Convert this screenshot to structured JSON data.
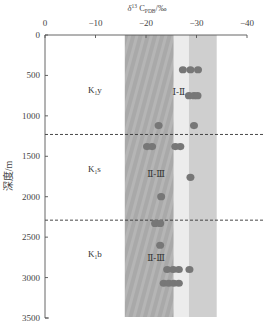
{
  "chart_data": {
    "type": "scatter",
    "xlabel": "δ13C PDB/‰",
    "ylabel": "深度/m",
    "x_axis_position": "top",
    "xlim": [
      0,
      -40
    ],
    "ylim": [
      0,
      3500
    ],
    "y_inverted": true,
    "xticks": [
      0,
      -10,
      -20,
      -30,
      -40
    ],
    "xtick_labels": [
      "0",
      "−10",
      "−20",
      "−30",
      "−40"
    ],
    "yticks": [
      0,
      500,
      1000,
      1500,
      2000,
      2500,
      3000,
      3500
    ],
    "ytick_labels": [
      "0",
      "500",
      "1000",
      "1500",
      "2000",
      "2500",
      "3000",
      "3500"
    ],
    "grid": false,
    "bands": [
      {
        "name": "dark-band",
        "x_from": -15.8,
        "x_to": -25.5,
        "color": "#a8a8a8"
      },
      {
        "name": "light-band",
        "x_from": -25.5,
        "x_to": -28.5,
        "color": "#ececec"
      },
      {
        "name": "mid-band",
        "x_from": -28.5,
        "x_to": -34.0,
        "color": "#cfcfcf"
      }
    ],
    "boundaries": [
      {
        "depth": 1230,
        "style": "dashed"
      },
      {
        "depth": 2290,
        "style": "dashed"
      }
    ],
    "formations": [
      {
        "label": "K",
        "sub": "1",
        "suffix": "y",
        "x": -8.5,
        "depth": 720
      },
      {
        "label": "K",
        "sub": "1",
        "suffix": "s",
        "x": -8.5,
        "depth": 1700
      },
      {
        "label": "K",
        "sub": "1",
        "suffix": "b",
        "x": -8.5,
        "depth": 2750
      }
    ],
    "type_labels": [
      {
        "text": "Ⅰ-Ⅱ",
        "x": -26.5,
        "depth": 740
      },
      {
        "text": "Ⅱ-Ⅲ",
        "x": -22.0,
        "depth": 1760
      },
      {
        "text": "Ⅱ-Ⅲ",
        "x": -22.0,
        "depth": 2800
      }
    ],
    "series": [
      {
        "name": "samples",
        "color": "#777777",
        "points": [
          {
            "x": -27.3,
            "depth": 430
          },
          {
            "x": -28.8,
            "depth": 430
          },
          {
            "x": -30.3,
            "depth": 430
          },
          {
            "x": -28.5,
            "depth": 750
          },
          {
            "x": -29.5,
            "depth": 750
          },
          {
            "x": -30.2,
            "depth": 750
          },
          {
            "x": -22.5,
            "depth": 1120
          },
          {
            "x": -29.5,
            "depth": 1120
          },
          {
            "x": -20.2,
            "depth": 1380
          },
          {
            "x": -21.2,
            "depth": 1380
          },
          {
            "x": -25.8,
            "depth": 1380
          },
          {
            "x": -26.8,
            "depth": 1380
          },
          {
            "x": -28.8,
            "depth": 1760
          },
          {
            "x": -23.0,
            "depth": 2000
          },
          {
            "x": -21.8,
            "depth": 2330
          },
          {
            "x": -22.8,
            "depth": 2330
          },
          {
            "x": -22.8,
            "depth": 2600
          },
          {
            "x": -24.2,
            "depth": 2900
          },
          {
            "x": -25.4,
            "depth": 2900
          },
          {
            "x": -26.5,
            "depth": 2900
          },
          {
            "x": -28.6,
            "depth": 2900
          },
          {
            "x": -23.5,
            "depth": 3070
          },
          {
            "x": -24.5,
            "depth": 3070
          },
          {
            "x": -25.5,
            "depth": 3070
          },
          {
            "x": -26.5,
            "depth": 3070
          }
        ]
      }
    ]
  }
}
